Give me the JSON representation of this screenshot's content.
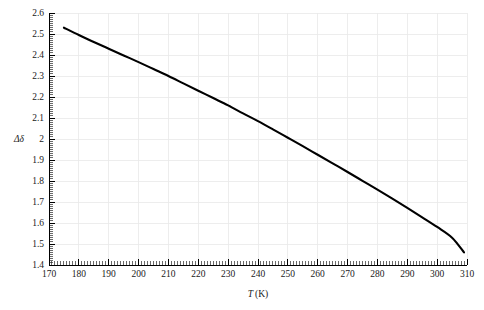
{
  "chart_data": {
    "type": "line",
    "title": "",
    "subtitle": "",
    "xlabel": "T (K)",
    "xlabel_symbol": "T",
    "xlabel_unit": "(K)",
    "ylabel": "Δδ",
    "xlim": [
      170,
      310
    ],
    "ylim": [
      1.4,
      2.6
    ],
    "grid": true,
    "grid_color": "#e9e9e9",
    "legend": null,
    "legend_position": "none",
    "line_color": "#000000",
    "x_major_step": 10,
    "y_major_step": 0.1,
    "x_minor_per_major": 10,
    "y_minor_per_major": 10,
    "xticks": [
      170,
      180,
      190,
      200,
      210,
      220,
      230,
      240,
      250,
      260,
      270,
      280,
      290,
      300,
      310
    ],
    "xtick_labels": [
      "170",
      "180",
      "190",
      "200",
      "210",
      "220",
      "230",
      "240",
      "250",
      "260",
      "270",
      "280",
      "290",
      "300",
      "310"
    ],
    "yticks": [
      1.4,
      1.5,
      1.6,
      1.7,
      1.8,
      1.9,
      2.0,
      2.1,
      2.2,
      2.3,
      2.4,
      2.5,
      2.6
    ],
    "ytick_labels": [
      "1.4",
      "1.5",
      "1.6",
      "1.7",
      "1.8",
      "1.9",
      "2",
      "2.1",
      "2.2",
      "2.3",
      "2.4",
      "2.5",
      "2.6"
    ],
    "series": [
      {
        "name": "delta-delta-vs-temperature",
        "x": [
          175,
          180,
          185,
          190,
          195,
          200,
          205,
          210,
          215,
          220,
          225,
          230,
          235,
          240,
          245,
          250,
          255,
          260,
          265,
          270,
          275,
          280,
          285,
          290,
          295,
          300,
          305,
          309
        ],
        "values": [
          2.53,
          2.495,
          2.462,
          2.43,
          2.398,
          2.366,
          2.333,
          2.3,
          2.265,
          2.23,
          2.195,
          2.16,
          2.122,
          2.085,
          2.046,
          2.006,
          1.966,
          1.925,
          1.884,
          1.843,
          1.801,
          1.759,
          1.716,
          1.672,
          1.627,
          1.581,
          1.53,
          1.46
        ]
      }
    ]
  },
  "figure": {
    "background": "#ffffff",
    "plot_area": {
      "left_px": 49,
      "right_px": 467,
      "top_px": 13,
      "bottom_px": 265
    }
  }
}
